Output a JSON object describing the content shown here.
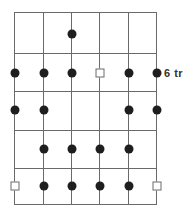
{
  "diagram": {
    "grid": {
      "x_lines": [
        14,
        43,
        71,
        99,
        128,
        156
      ],
      "y_lines": [
        12,
        53,
        91,
        130,
        168,
        204
      ],
      "line_color": "#6a6a6a"
    },
    "rows": [
      {
        "y": 34,
        "markers": [
          null,
          null,
          "dot",
          null,
          null,
          null
        ]
      },
      {
        "y": 73,
        "markers": [
          "dot",
          "dot",
          "dot",
          "square",
          "dot",
          "dot"
        ],
        "label": "6 tr"
      },
      {
        "y": 110,
        "markers": [
          "dot",
          "dot",
          null,
          null,
          "dot",
          "dot"
        ]
      },
      {
        "y": 149,
        "markers": [
          null,
          "dot",
          "dot",
          "dot",
          "dot",
          null
        ]
      },
      {
        "y": 186,
        "markers": [
          "square",
          "dot",
          "dot",
          "dot",
          "dot",
          "square"
        ]
      }
    ],
    "row_label": "6 tr",
    "dot_color": "#1e1e1e"
  }
}
